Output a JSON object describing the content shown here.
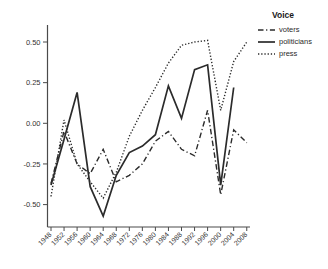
{
  "chart_data": {
    "type": "line",
    "title": "",
    "legend_title": "Voice",
    "legend_position": "top-right",
    "grid": false,
    "line_color": "#2b2b2b",
    "axis_color": "#4a4a4a",
    "text_color": "#333333",
    "x_categories": [
      "1948",
      "1952",
      "1956",
      "1960",
      "1964",
      "1968",
      "1972",
      "1976",
      "1980",
      "1984",
      "1988",
      "1992",
      "1996",
      "2000",
      "2004",
      "2008"
    ],
    "y_ticks": [
      "0.50",
      "0.25",
      "0.00",
      "-0.25",
      "-0.50"
    ],
    "y_tick_values": [
      0.5,
      0.25,
      0.0,
      -0.25,
      -0.5
    ],
    "ylim": [
      -0.62,
      0.58
    ],
    "series": [
      {
        "name": "voters",
        "style": "dashdot",
        "values": [
          -0.37,
          -0.05,
          -0.25,
          -0.31,
          -0.16,
          -0.36,
          -0.32,
          -0.25,
          -0.11,
          -0.05,
          -0.16,
          -0.2,
          0.08,
          -0.44,
          -0.04,
          -0.12
        ]
      },
      {
        "name": "politicians",
        "style": "solid",
        "values": [
          -0.38,
          -0.1,
          0.19,
          -0.39,
          -0.57,
          -0.32,
          -0.18,
          -0.14,
          -0.07,
          0.23,
          0.03,
          0.33,
          0.36,
          -0.38,
          0.22,
          null
        ]
      },
      {
        "name": "press",
        "style": "dotted",
        "values": [
          -0.45,
          0.02,
          -0.25,
          -0.36,
          -0.46,
          -0.3,
          -0.08,
          0.08,
          0.22,
          0.37,
          0.48,
          0.5,
          0.51,
          0.08,
          0.38,
          0.5
        ]
      }
    ]
  },
  "legend": {
    "title": "Voice",
    "items": [
      {
        "label": "voters"
      },
      {
        "label": "politicians"
      },
      {
        "label": "press"
      }
    ]
  }
}
